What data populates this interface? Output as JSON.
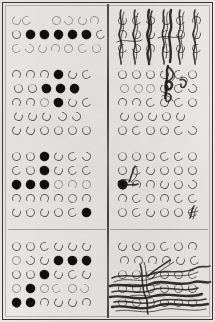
{
  "document": {
    "title": "Scanned bubble answer sheet",
    "media": "photocopied paper form",
    "paper_color": "#f2f0ec",
    "ink_color": "#1d1b19",
    "frame_color": "#3a3733",
    "layout": "two columns separated by a vertical rule, four stacked answer blocks per column"
  },
  "columns": [
    {
      "name": "left-column",
      "blocks": [
        {
          "name": "left-block-1",
          "rows": 3,
          "columns": 7,
          "marks": [
            {
              "row": 1,
              "pattern": [
                "open",
                "open",
                "blank",
                "blank",
                "open",
                "open",
                "open"
              ]
            },
            {
              "row": 2,
              "pattern": [
                "open",
                "filled",
                "filled",
                "filled",
                "filled",
                "filled",
                "open"
              ]
            },
            {
              "row": 3,
              "pattern": [
                "faint",
                "faint",
                "faint",
                "faint",
                "faint",
                "faint",
                "faint"
              ]
            }
          ],
          "filled_count": 5,
          "overwritten": false
        },
        {
          "name": "left-block-2",
          "rows": 5,
          "columns": 6,
          "marks": [
            {
              "row": 1,
              "pattern": [
                "open",
                "open",
                "open",
                "filled",
                "open",
                "open"
              ]
            },
            {
              "row": 2,
              "pattern": [
                "open",
                "open",
                "filled",
                "filled",
                "filled",
                "blank"
              ]
            },
            {
              "row": 3,
              "pattern": [
                "open",
                "open",
                "faint",
                "filled",
                "open",
                "open"
              ]
            },
            {
              "row": 4,
              "pattern": [
                "open",
                "open",
                "open",
                "open",
                "open",
                "blank"
              ]
            },
            {
              "row": 5,
              "pattern": [
                "open",
                "open",
                "open",
                "open",
                "open",
                "open"
              ]
            }
          ],
          "filled_count": 5,
          "overwritten": false
        },
        {
          "name": "left-block-3",
          "rows": 5,
          "columns": 6,
          "marks": [
            {
              "row": 1,
              "pattern": [
                "open",
                "open",
                "filled",
                "open",
                "open",
                "open"
              ]
            },
            {
              "row": 2,
              "pattern": [
                "open",
                "open",
                "filled",
                "open",
                "open",
                "open"
              ]
            },
            {
              "row": 3,
              "pattern": [
                "filled",
                "filled",
                "filled",
                "open",
                "open",
                "open"
              ]
            },
            {
              "row": 4,
              "pattern": [
                "open",
                "open",
                "open",
                "open",
                "open",
                "open"
              ]
            },
            {
              "row": 5,
              "pattern": [
                "open",
                "open",
                "open",
                "open",
                "open",
                "filled"
              ]
            }
          ],
          "filled_count": 6,
          "overwritten": false
        },
        {
          "name": "left-block-4",
          "rows": 5,
          "columns": 6,
          "marks": [
            {
              "row": 1,
              "pattern": [
                "open",
                "open",
                "open",
                "open",
                "open",
                "open"
              ]
            },
            {
              "row": 2,
              "pattern": [
                "open",
                "open",
                "open",
                "filled",
                "filled",
                "filled"
              ]
            },
            {
              "row": 3,
              "pattern": [
                "open",
                "open",
                "filled",
                "open",
                "open",
                "open"
              ]
            },
            {
              "row": 4,
              "pattern": [
                "open",
                "filled",
                "open",
                "open",
                "blank",
                "open"
              ]
            },
            {
              "row": 5,
              "pattern": [
                "filled",
                "filled",
                "open",
                "open",
                "open",
                "open"
              ]
            }
          ],
          "filled_count": 7,
          "overwritten": false
        }
      ]
    },
    {
      "name": "right-column",
      "blocks": [
        {
          "name": "right-block-1",
          "rows": 3,
          "columns": 6,
          "marks": [
            {
              "row": 1,
              "pattern": [
                "open",
                "open",
                "open",
                "open",
                "open",
                "open"
              ]
            },
            {
              "row": 2,
              "pattern": [
                "open",
                "open",
                "open",
                "open",
                "open",
                "open"
              ]
            },
            {
              "row": 3,
              "pattern": [
                "open",
                "open",
                "open",
                "open",
                "open",
                "open"
              ]
            }
          ],
          "filled_count": 0,
          "overwritten": true,
          "overwrite_style": "vertical pen strokes struck down through every column"
        },
        {
          "name": "right-block-2",
          "rows": 5,
          "columns": 6,
          "marks": [
            {
              "row": 1,
              "pattern": [
                "open",
                "open",
                "open",
                "open",
                "open",
                "open"
              ]
            },
            {
              "row": 2,
              "pattern": [
                "faint",
                "faint",
                "faint",
                "open",
                "open",
                "open"
              ]
            },
            {
              "row": 3,
              "pattern": [
                "open",
                "open",
                "open",
                "open",
                "open",
                "open"
              ]
            },
            {
              "row": 4,
              "pattern": [
                "open",
                "open",
                "open",
                "open",
                "open",
                "blank"
              ]
            },
            {
              "row": 5,
              "pattern": [
                "open",
                "open",
                "open",
                "open",
                "open",
                "open"
              ]
            }
          ],
          "filled_count": 0,
          "overwritten": true,
          "overwrite_style": "hooked pen stroke drawn down through columns four and five of the first three rows"
        },
        {
          "name": "right-block-3",
          "rows": 5,
          "columns": 6,
          "marks": [
            {
              "row": 1,
              "pattern": [
                "open",
                "open",
                "open",
                "open",
                "open",
                "open"
              ]
            },
            {
              "row": 2,
              "pattern": [
                "open",
                "open",
                "open",
                "open",
                "open",
                "open"
              ]
            },
            {
              "row": 3,
              "pattern": [
                "filled",
                "open",
                "open",
                "open",
                "open",
                "open"
              ]
            },
            {
              "row": 4,
              "pattern": [
                "open",
                "open",
                "open",
                "open",
                "open",
                "open"
              ]
            },
            {
              "row": 5,
              "pattern": [
                "open",
                "open",
                "open",
                "open",
                "open",
                "open"
              ]
            }
          ],
          "filled_count": 1,
          "overwritten": true,
          "overwrite_style": "short hooked stroke over the first two bubbles of row three and a small slash on the last bubble of row five"
        },
        {
          "name": "right-block-4",
          "rows": 5,
          "columns": 6,
          "marks": [
            {
              "row": 1,
              "pattern": [
                "open",
                "open",
                "open",
                "open",
                "open",
                "open"
              ]
            },
            {
              "row": 2,
              "pattern": [
                "open",
                "open",
                "open",
                "open",
                "open",
                "open"
              ]
            },
            {
              "row": 3,
              "pattern": [
                "open",
                "open",
                "open",
                "open",
                "open",
                "open"
              ]
            },
            {
              "row": 4,
              "pattern": [
                "open",
                "open",
                "open",
                "open",
                "open",
                "open"
              ]
            },
            {
              "row": 5,
              "pattern": [
                "open",
                "open",
                "open",
                "open",
                "open",
                "open"
              ]
            }
          ],
          "filled_count": 0,
          "overwritten": true,
          "overwrite_style": "heavy horizontal scribble scrawled across the lower three rows, crossing the block out"
        }
      ]
    }
  ],
  "rules": {
    "vertical_divider": "centre vertical rule",
    "horizontal_dividers": 1
  }
}
